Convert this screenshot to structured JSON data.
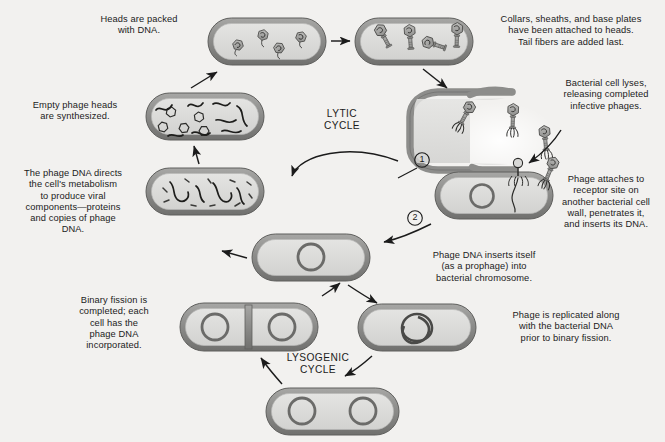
{
  "figure": {
    "background_color": "#f2f1ef",
    "cell_wall_color": "#8e8e8e",
    "cell_interior_color": "#dcdcda",
    "ink_color": "#1b1b1b"
  },
  "cycle_labels": {
    "lytic": "LYTIC\nCYCLE",
    "lysogenic": "LYSOGENIC\nCYCLE"
  },
  "step_markers": [
    {
      "id": "1",
      "label": "1"
    },
    {
      "id": "2",
      "label": "2"
    }
  ],
  "captions": [
    {
      "id": "heads-packed",
      "text": "Heads are packed\nwith DNA.",
      "position": "top-center-left"
    },
    {
      "id": "collars-sheaths",
      "text": "Collars, sheaths, and base plates\nhave been attached to heads.\nTail fibers are added last.",
      "position": "top-right"
    },
    {
      "id": "cell-lyses",
      "text": "Bacterial cell lyses,\nreleasing completed\ninfective phages.",
      "position": "right-upper"
    },
    {
      "id": "phage-attaches",
      "text": "Phage attaches to\nreceptor site on\nanother bacterial cell\nwall, penetrates it,\nand inserts its DNA.",
      "position": "right-middle"
    },
    {
      "id": "empty-heads",
      "text": "Empty phage heads\nare synthesized.",
      "position": "left-upper"
    },
    {
      "id": "phage-dna-directs",
      "text": "The phage DNA directs\nthe cell's metabolism\nto produce viral\ncomponents—proteins\nand copies of phage\nDNA.",
      "position": "left-middle"
    },
    {
      "id": "prophage-inserts",
      "text": "Phage DNA inserts itself\n(as a prophage) into\nbacterial chromosome.",
      "position": "center-right"
    },
    {
      "id": "phage-replicated",
      "text": "Phage is replicated along\nwith the bacterial DNA\nprior to binary fission.",
      "position": "right-lower"
    },
    {
      "id": "binary-fission",
      "text": "Binary fission is\ncompleted; each\ncell has the\nphage DNA\nincorporated.",
      "position": "left-lower"
    }
  ],
  "cells": [
    {
      "id": "cell-packed-heads",
      "stage": "Heads packed with DNA",
      "contents": "4 phage heads filled with DNA",
      "shape": "rod"
    },
    {
      "id": "cell-assembled-phages",
      "stage": "Complete phages assembled",
      "contents": "4 complete phages with tails",
      "shape": "rod"
    },
    {
      "id": "cell-lysing",
      "stage": "Cell lysis",
      "contents": "phages escaping",
      "shape": "open-c"
    },
    {
      "id": "cell-infected",
      "stage": "Phage attaches and injects DNA",
      "contents": "bacterial chromosome",
      "shape": "rod"
    },
    {
      "id": "cell-empty-heads",
      "stage": "Empty phage heads synthesized",
      "contents": "empty hexagonal heads and DNA strands",
      "shape": "rod"
    },
    {
      "id": "cell-viral-components",
      "stage": "Viral components produced",
      "contents": "phage DNA strands and proteins",
      "shape": "rod"
    },
    {
      "id": "cell-prophage",
      "stage": "Prophage integrated",
      "contents": "bacterial chromosome with prophage",
      "shape": "rod"
    },
    {
      "id": "cell-replicating",
      "stage": "Chromosome replicated",
      "contents": "replicating chromosome loop",
      "shape": "rod"
    },
    {
      "id": "cell-dividing",
      "stage": "Binary fission",
      "contents": "two chromosomes, septum formed",
      "shape": "rod-divided"
    },
    {
      "id": "cell-two-chromosomes",
      "stage": "Chromosome replicated, pre-division",
      "contents": "two chromosomes",
      "shape": "rod"
    }
  ]
}
